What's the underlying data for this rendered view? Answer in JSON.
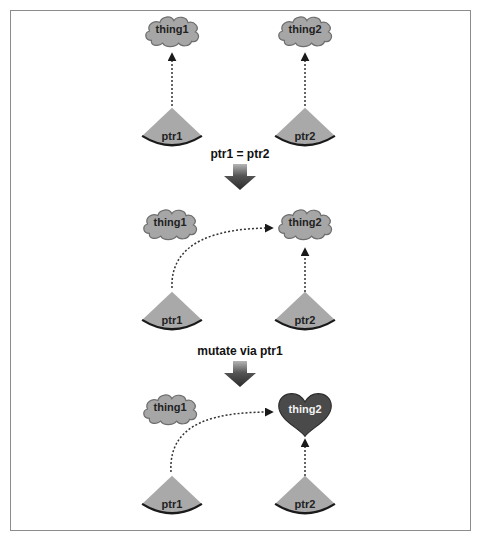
{
  "diagram": {
    "stages": [
      {
        "things": [
          {
            "label": "thing1",
            "shape": "cloud"
          },
          {
            "label": "thing2",
            "shape": "cloud"
          }
        ],
        "pointers": [
          {
            "label": "ptr1",
            "points_to": "thing1"
          },
          {
            "label": "ptr2",
            "points_to": "thing2"
          }
        ]
      },
      {
        "things": [
          {
            "label": "thing1",
            "shape": "cloud"
          },
          {
            "label": "thing2",
            "shape": "cloud"
          }
        ],
        "pointers": [
          {
            "label": "ptr1",
            "points_to": "thing2"
          },
          {
            "label": "ptr2",
            "points_to": "thing2"
          }
        ]
      },
      {
        "things": [
          {
            "label": "thing1",
            "shape": "cloud"
          },
          {
            "label": "thing2",
            "shape": "heart"
          }
        ],
        "pointers": [
          {
            "label": "ptr1",
            "points_to": "thing2"
          },
          {
            "label": "ptr2",
            "points_to": "thing2"
          }
        ]
      }
    ],
    "transitions": [
      {
        "label": "ptr1 = ptr2"
      },
      {
        "label": "mutate via ptr1"
      }
    ],
    "colors": {
      "cloud_fill": "#a6a6a6",
      "cloud_stroke": "#6e6e6e",
      "sector_fill": "#a9a9a9",
      "sector_arc": "#1a1a1a",
      "heart_fill": "#4a4a4a",
      "arrow": "#333333",
      "frame": "#8c8c8c"
    }
  }
}
